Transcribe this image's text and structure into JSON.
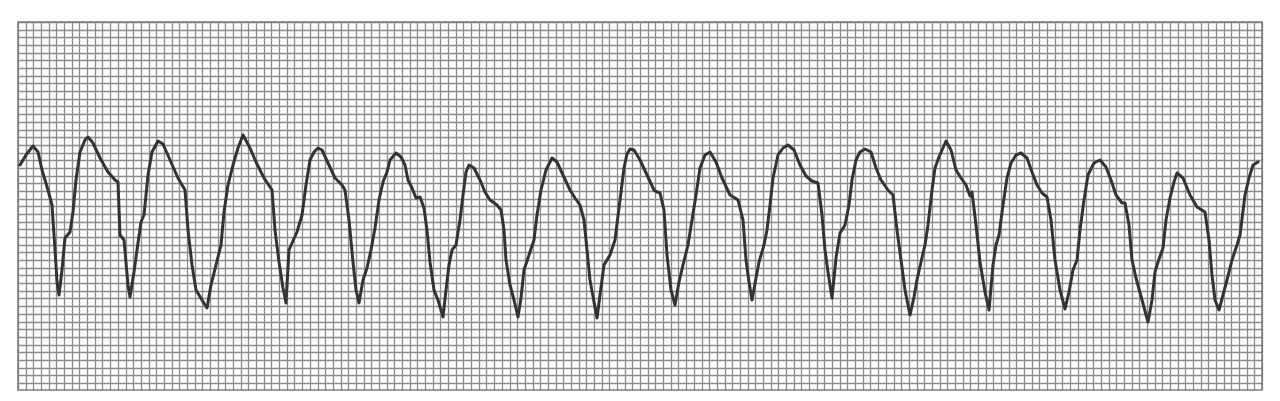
{
  "strip": {
    "label": "ECG rhythm strip",
    "grid": {
      "x0": 18,
      "y0": 22,
      "x1": 1262,
      "y1": 390,
      "spacing": 7.68,
      "line_color": "#8c8c8c",
      "background": "#ffffff"
    },
    "trace": {
      "color": "#333333",
      "width": 3
    },
    "complex_count": 16
  },
  "trace_points": [
    [
      20,
      165
    ],
    [
      26,
      155
    ],
    [
      33,
      146
    ],
    [
      38,
      152
    ],
    [
      42,
      170
    ],
    [
      48,
      190
    ],
    [
      52,
      205
    ],
    [
      55,
      250
    ],
    [
      57,
      282
    ],
    [
      59,
      295
    ],
    [
      62,
      270
    ],
    [
      65,
      238
    ],
    [
      70,
      232
    ],
    [
      73,
      212
    ],
    [
      76,
      180
    ],
    [
      80,
      152
    ],
    [
      85,
      140
    ],
    [
      88,
      137
    ],
    [
      93,
      143
    ],
    [
      100,
      158
    ],
    [
      108,
      172
    ],
    [
      115,
      180
    ],
    [
      118,
      182
    ],
    [
      120,
      235
    ],
    [
      124,
      240
    ],
    [
      128,
      285
    ],
    [
      130,
      297
    ],
    [
      134,
      272
    ],
    [
      137,
      250
    ],
    [
      141,
      222
    ],
    [
      144,
      215
    ],
    [
      148,
      175
    ],
    [
      152,
      152
    ],
    [
      158,
      141
    ],
    [
      163,
      144
    ],
    [
      170,
      160
    ],
    [
      178,
      178
    ],
    [
      185,
      190
    ],
    [
      188,
      230
    ],
    [
      192,
      265
    ],
    [
      196,
      290
    ],
    [
      202,
      300
    ],
    [
      207,
      308
    ],
    [
      211,
      285
    ],
    [
      216,
      265
    ],
    [
      221,
      245
    ],
    [
      224,
      212
    ],
    [
      228,
      185
    ],
    [
      233,
      165
    ],
    [
      238,
      148
    ],
    [
      243,
      135
    ],
    [
      250,
      148
    ],
    [
      256,
      162
    ],
    [
      264,
      178
    ],
    [
      272,
      190
    ],
    [
      275,
      230
    ],
    [
      279,
      262
    ],
    [
      283,
      288
    ],
    [
      286,
      303
    ],
    [
      289,
      250
    ],
    [
      292,
      243
    ],
    [
      297,
      232
    ],
    [
      302,
      215
    ],
    [
      306,
      185
    ],
    [
      310,
      160
    ],
    [
      314,
      152
    ],
    [
      318,
      148
    ],
    [
      322,
      150
    ],
    [
      328,
      163
    ],
    [
      335,
      178
    ],
    [
      342,
      185
    ],
    [
      345,
      190
    ],
    [
      349,
      220
    ],
    [
      353,
      262
    ],
    [
      356,
      290
    ],
    [
      359,
      303
    ],
    [
      363,
      280
    ],
    [
      367,
      268
    ],
    [
      371,
      250
    ],
    [
      375,
      228
    ],
    [
      379,
      200
    ],
    [
      383,
      182
    ],
    [
      387,
      172
    ],
    [
      390,
      160
    ],
    [
      396,
      153
    ],
    [
      401,
      157
    ],
    [
      405,
      165
    ],
    [
      408,
      180
    ],
    [
      412,
      188
    ],
    [
      416,
      198
    ],
    [
      420,
      197
    ],
    [
      424,
      208
    ],
    [
      427,
      230
    ],
    [
      430,
      262
    ],
    [
      434,
      290
    ],
    [
      438,
      300
    ],
    [
      443,
      317
    ],
    [
      446,
      290
    ],
    [
      449,
      265
    ],
    [
      452,
      250
    ],
    [
      456,
      245
    ],
    [
      460,
      220
    ],
    [
      463,
      195
    ],
    [
      466,
      172
    ],
    [
      469,
      165
    ],
    [
      474,
      168
    ],
    [
      480,
      180
    ],
    [
      485,
      192
    ],
    [
      490,
      200
    ],
    [
      497,
      205
    ],
    [
      501,
      210
    ],
    [
      504,
      230
    ],
    [
      506,
      260
    ],
    [
      510,
      285
    ],
    [
      514,
      300
    ],
    [
      518,
      317
    ],
    [
      521,
      298
    ],
    [
      524,
      270
    ],
    [
      529,
      255
    ],
    [
      534,
      240
    ],
    [
      537,
      215
    ],
    [
      541,
      190
    ],
    [
      546,
      170
    ],
    [
      552,
      158
    ],
    [
      557,
      162
    ],
    [
      563,
      175
    ],
    [
      570,
      190
    ],
    [
      575,
      198
    ],
    [
      580,
      205
    ],
    [
      584,
      220
    ],
    [
      587,
      250
    ],
    [
      590,
      280
    ],
    [
      594,
      302
    ],
    [
      597,
      318
    ],
    [
      600,
      295
    ],
    [
      604,
      265
    ],
    [
      610,
      255
    ],
    [
      615,
      240
    ],
    [
      620,
      200
    ],
    [
      624,
      168
    ],
    [
      627,
      154
    ],
    [
      630,
      149
    ],
    [
      634,
      150
    ],
    [
      640,
      160
    ],
    [
      647,
      175
    ],
    [
      654,
      190
    ],
    [
      657,
      192
    ],
    [
      660,
      193
    ],
    [
      664,
      210
    ],
    [
      667,
      255
    ],
    [
      671,
      290
    ],
    [
      675,
      305
    ],
    [
      679,
      282
    ],
    [
      683,
      265
    ],
    [
      688,
      245
    ],
    [
      692,
      220
    ],
    [
      696,
      195
    ],
    [
      700,
      168
    ],
    [
      705,
      155
    ],
    [
      710,
      152
    ],
    [
      716,
      162
    ],
    [
      722,
      178
    ],
    [
      730,
      195
    ],
    [
      735,
      198
    ],
    [
      738,
      200
    ],
    [
      743,
      220
    ],
    [
      746,
      260
    ],
    [
      749,
      282
    ],
    [
      752,
      300
    ],
    [
      756,
      278
    ],
    [
      759,
      262
    ],
    [
      764,
      245
    ],
    [
      767,
      230
    ],
    [
      770,
      205
    ],
    [
      773,
      178
    ],
    [
      778,
      155
    ],
    [
      783,
      148
    ],
    [
      788,
      145
    ],
    [
      794,
      150
    ],
    [
      800,
      165
    ],
    [
      806,
      176
    ],
    [
      812,
      181
    ],
    [
      818,
      183
    ],
    [
      822,
      215
    ],
    [
      825,
      250
    ],
    [
      828,
      272
    ],
    [
      832,
      298
    ],
    [
      836,
      258
    ],
    [
      840,
      233
    ],
    [
      845,
      225
    ],
    [
      849,
      205
    ],
    [
      852,
      180
    ],
    [
      856,
      160
    ],
    [
      860,
      152
    ],
    [
      865,
      149
    ],
    [
      871,
      152
    ],
    [
      876,
      168
    ],
    [
      881,
      180
    ],
    [
      888,
      190
    ],
    [
      893,
      195
    ],
    [
      897,
      230
    ],
    [
      901,
      260
    ],
    [
      905,
      290
    ],
    [
      910,
      315
    ],
    [
      914,
      297
    ],
    [
      917,
      280
    ],
    [
      921,
      262
    ],
    [
      925,
      245
    ],
    [
      928,
      225
    ],
    [
      932,
      190
    ],
    [
      935,
      168
    ],
    [
      939,
      157
    ],
    [
      946,
      141
    ],
    [
      951,
      150
    ],
    [
      956,
      170
    ],
    [
      961,
      178
    ],
    [
      966,
      185
    ],
    [
      970,
      196
    ],
    [
      972,
      192
    ],
    [
      976,
      225
    ],
    [
      980,
      262
    ],
    [
      985,
      292
    ],
    [
      989,
      310
    ],
    [
      993,
      265
    ],
    [
      996,
      245
    ],
    [
      999,
      235
    ],
    [
      1003,
      205
    ],
    [
      1007,
      178
    ],
    [
      1011,
      163
    ],
    [
      1016,
      155
    ],
    [
      1021,
      153
    ],
    [
      1027,
      158
    ],
    [
      1032,
      172
    ],
    [
      1037,
      185
    ],
    [
      1042,
      193
    ],
    [
      1047,
      197
    ],
    [
      1051,
      220
    ],
    [
      1055,
      260
    ],
    [
      1060,
      290
    ],
    [
      1065,
      309
    ],
    [
      1069,
      292
    ],
    [
      1073,
      270
    ],
    [
      1077,
      260
    ],
    [
      1080,
      230
    ],
    [
      1084,
      200
    ],
    [
      1088,
      175
    ],
    [
      1094,
      163
    ],
    [
      1100,
      160
    ],
    [
      1106,
      167
    ],
    [
      1111,
      180
    ],
    [
      1116,
      195
    ],
    [
      1122,
      203
    ],
    [
      1125,
      203
    ],
    [
      1129,
      225
    ],
    [
      1132,
      260
    ],
    [
      1136,
      278
    ],
    [
      1142,
      300
    ],
    [
      1148,
      322
    ],
    [
      1152,
      300
    ],
    [
      1155,
      272
    ],
    [
      1158,
      262
    ],
    [
      1163,
      248
    ],
    [
      1166,
      220
    ],
    [
      1170,
      198
    ],
    [
      1174,
      182
    ],
    [
      1177,
      173
    ],
    [
      1183,
      178
    ],
    [
      1190,
      195
    ],
    [
      1197,
      207
    ],
    [
      1205,
      212
    ],
    [
      1209,
      240
    ],
    [
      1212,
      275
    ],
    [
      1215,
      300
    ],
    [
      1219,
      310
    ],
    [
      1223,
      295
    ],
    [
      1227,
      280
    ],
    [
      1232,
      260
    ],
    [
      1237,
      245
    ],
    [
      1240,
      235
    ],
    [
      1245,
      195
    ],
    [
      1249,
      178
    ],
    [
      1253,
      165
    ],
    [
      1258,
      162
    ]
  ]
}
